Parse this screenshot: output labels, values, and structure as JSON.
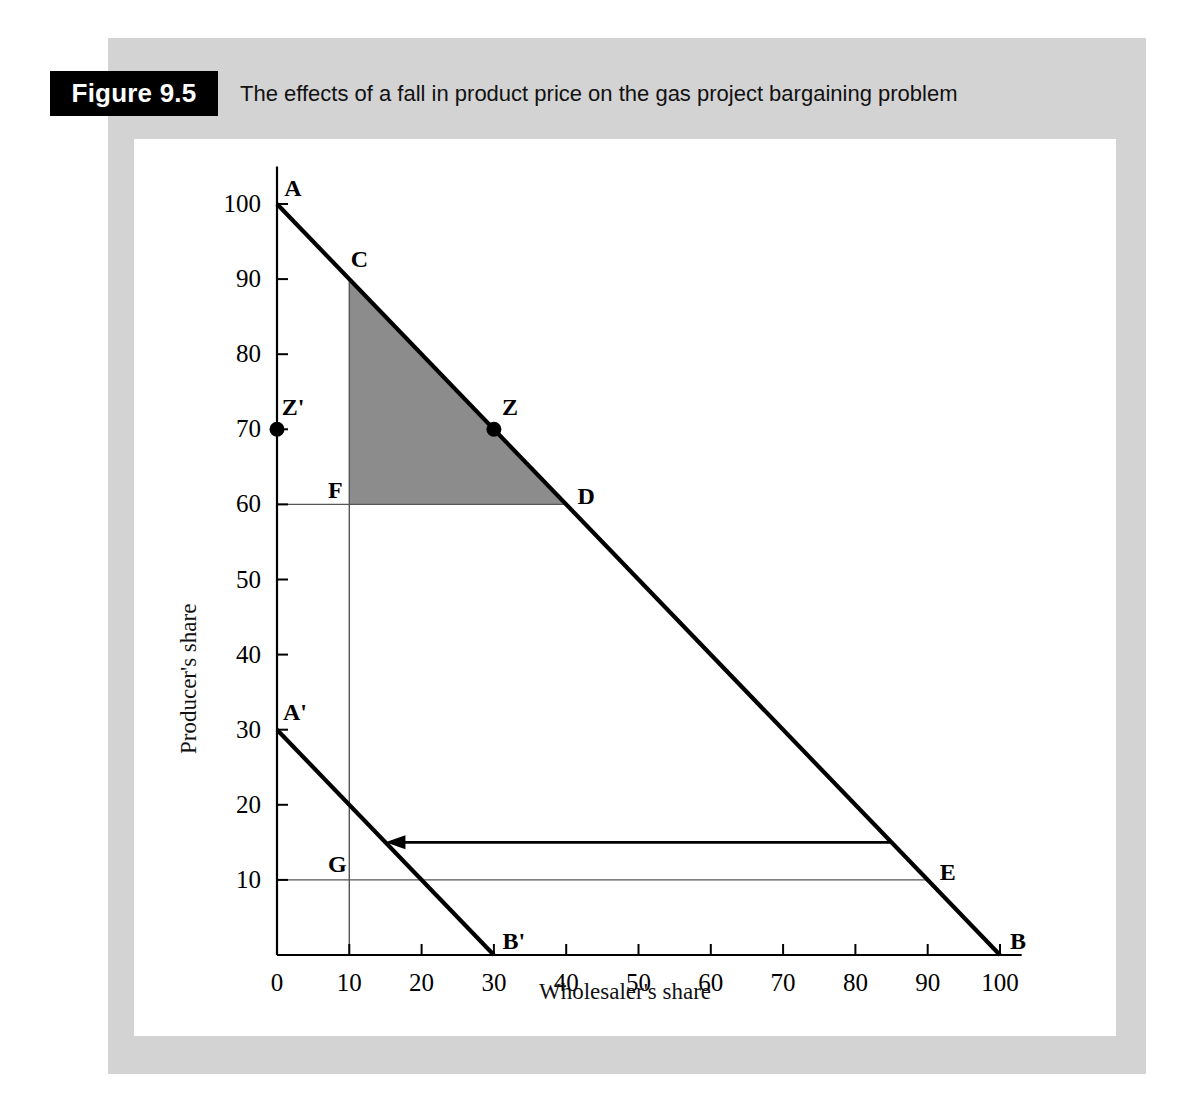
{
  "figure": {
    "tag": "Figure 9.5",
    "title": "The effects of a fall in product price on the gas project bargaining problem"
  },
  "chart_data": {
    "type": "line",
    "title": "The effects of a fall in product price on the gas project bargaining problem",
    "xlabel": "Wholesaler's share",
    "ylabel": "Producer's share",
    "xlim": [
      0,
      103
    ],
    "ylim": [
      0,
      105
    ],
    "xticks": [
      0,
      10,
      20,
      30,
      40,
      50,
      60,
      70,
      80,
      90,
      100
    ],
    "yticks": [
      10,
      20,
      30,
      40,
      50,
      60,
      70,
      80,
      90,
      100
    ],
    "xticklabels": [
      "0",
      "10",
      "20",
      "30",
      "40",
      "50",
      "60",
      "70",
      "80",
      "90",
      "100"
    ],
    "yticklabels": [
      "10",
      "20",
      "30",
      "40",
      "50",
      "60",
      "70",
      "80",
      "90",
      "100"
    ],
    "grid": false,
    "legend": null,
    "series": [
      {
        "name": "AB",
        "type": "line",
        "style": "thick-solid",
        "x": [
          0,
          100
        ],
        "y": [
          100,
          0
        ]
      },
      {
        "name": "A'B'",
        "type": "line",
        "style": "thick-solid",
        "x": [
          0,
          30
        ],
        "y": [
          30,
          0
        ]
      },
      {
        "name": "FD horizontal at 60",
        "type": "line",
        "style": "thin-solid",
        "x": [
          0,
          40
        ],
        "y": [
          60,
          60
        ]
      },
      {
        "name": "vertical at 10",
        "type": "line",
        "style": "thin-solid",
        "x": [
          10,
          10
        ],
        "y": [
          0,
          90
        ]
      },
      {
        "name": "GE horizontal at 10",
        "type": "line",
        "style": "thin-solid",
        "x": [
          0,
          90
        ],
        "y": [
          10,
          10
        ]
      }
    ],
    "shaded_region": {
      "name": "CFD bargaining set",
      "fill": "#8c8c8c",
      "vertices": [
        [
          10,
          90
        ],
        [
          10,
          60
        ],
        [
          40,
          60
        ]
      ]
    },
    "arrow": {
      "name": "price-fall-shift-arrow",
      "from": [
        85,
        15
      ],
      "to": [
        15,
        15
      ],
      "direction": "left"
    },
    "markers": [
      {
        "label": "Z",
        "x": 30,
        "y": 70,
        "filled": true
      },
      {
        "label": "Z'",
        "x": 0,
        "y": 70,
        "filled": true
      }
    ],
    "point_labels": [
      {
        "label": "A",
        "x": 0,
        "y": 100
      },
      {
        "label": "B",
        "x": 100,
        "y": 0
      },
      {
        "label": "A'",
        "x": 0,
        "y": 30
      },
      {
        "label": "B'",
        "x": 30,
        "y": 0
      },
      {
        "label": "C",
        "x": 10,
        "y": 90
      },
      {
        "label": "D",
        "x": 40,
        "y": 60
      },
      {
        "label": "E",
        "x": 90,
        "y": 10
      },
      {
        "label": "F",
        "x": 10,
        "y": 60
      },
      {
        "label": "G",
        "x": 10,
        "y": 10
      },
      {
        "label": "Z",
        "x": 30,
        "y": 70
      },
      {
        "label": "Z'",
        "x": 0,
        "y": 70
      }
    ]
  },
  "colors": {
    "panel_gray": "#d3d3d3",
    "shade_gray": "#8c8c8c",
    "ink": "#000000",
    "tag_bg": "#000000",
    "tag_fg": "#ffffff"
  }
}
